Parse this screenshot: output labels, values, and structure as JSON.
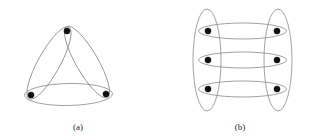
{
  "figure": {
    "background_color": "#ffffff",
    "edge_color": "#8a8a8a",
    "vertex_color": "#111111",
    "caption_color": "#2a2a2a",
    "width": 319,
    "height": 140
  },
  "panels": [
    {
      "id": "a",
      "caption": "(a)",
      "caption_x": 78,
      "caption_y": 130,
      "description": "triangular hypergraph with three vertices and three elongated elliptical hyperedges",
      "vertex_count": 3,
      "hyperedge_count": 3,
      "vertices": [
        {
          "name": "vertex-top",
          "cx": 67,
          "cy": 31,
          "r": 3.1
        },
        {
          "name": "vertex-bottom-left",
          "cx": 31,
          "cy": 95,
          "r": 3.1
        },
        {
          "name": "vertex-bottom-right",
          "cx": 106,
          "cy": 94,
          "r": 3.1
        }
      ],
      "hyperedges": [
        {
          "name": "hyperedge-top-left",
          "cx": 49,
          "cy": 63,
          "rx": 41,
          "ry": 11,
          "rotation": -61
        },
        {
          "name": "hyperedge-top-right",
          "cx": 87,
          "cy": 62,
          "rx": 41,
          "ry": 11,
          "rotation": 60
        },
        {
          "name": "hyperedge-bottom",
          "cx": 68.5,
          "cy": 94.5,
          "rx": 44,
          "ry": 11,
          "rotation": -1
        }
      ]
    },
    {
      "id": "b",
      "caption": "(b)",
      "caption_x": 240,
      "caption_y": 130,
      "description": "bipartite-style hypergraph with six vertices, two tall vertical hyperedges and three wide horizontal hyperedges",
      "vertex_count": 6,
      "hyperedge_count": 5,
      "vertices": [
        {
          "name": "vertex-left-top",
          "cx": 208,
          "cy": 31,
          "r": 3.1
        },
        {
          "name": "vertex-left-middle",
          "cx": 208,
          "cy": 60,
          "r": 3.1
        },
        {
          "name": "vertex-left-bottom",
          "cx": 208,
          "cy": 89,
          "r": 3.1
        },
        {
          "name": "vertex-right-top",
          "cx": 277,
          "cy": 31,
          "r": 3.1
        },
        {
          "name": "vertex-right-middle",
          "cx": 277,
          "cy": 60,
          "r": 3.1
        },
        {
          "name": "vertex-right-bottom",
          "cx": 277,
          "cy": 89,
          "r": 3.1
        }
      ],
      "hyperedges": [
        {
          "name": "hyperedge-left-column",
          "cx": 207,
          "cy": 60,
          "rx": 14,
          "ry": 51,
          "rotation": 0
        },
        {
          "name": "hyperedge-right-column",
          "cx": 278,
          "cy": 60,
          "rx": 14,
          "ry": 51,
          "rotation": 0
        },
        {
          "name": "hyperedge-row-top",
          "cx": 242.5,
          "cy": 31,
          "rx": 44,
          "ry": 8,
          "rotation": 0
        },
        {
          "name": "hyperedge-row-middle",
          "cx": 242.5,
          "cy": 60,
          "rx": 44,
          "ry": 8,
          "rotation": 0
        },
        {
          "name": "hyperedge-row-bottom",
          "cx": 242.5,
          "cy": 89,
          "rx": 44,
          "ry": 8,
          "rotation": 0
        }
      ]
    }
  ]
}
